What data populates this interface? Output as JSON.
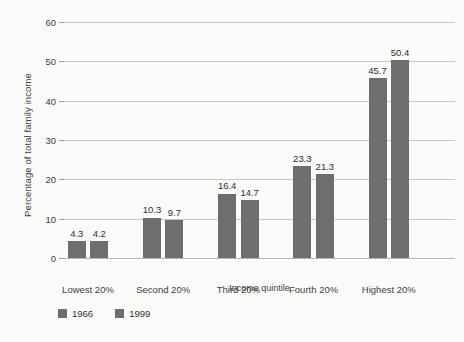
{
  "chart_data": {
    "type": "bar",
    "title": "",
    "xlabel": "Income quintile",
    "ylabel": "Percentage of total family income",
    "categories": [
      "Lowest 20%",
      "Second 20%",
      "Third 20%",
      "Fourth 20%",
      "Highest 20%"
    ],
    "series": [
      {
        "name": "1966",
        "values": [
          4.3,
          10.3,
          16.4,
          23.3,
          45.7
        ],
        "color": "#6e6e6e"
      },
      {
        "name": "1999",
        "values": [
          4.2,
          9.7,
          14.7,
          21.3,
          50.4
        ],
        "color": "#6e6e6e"
      }
    ],
    "ylim": [
      0,
      60
    ],
    "yticks": [
      0,
      10,
      20,
      30,
      40,
      50,
      60
    ],
    "ytick_labels": [
      "0",
      "10",
      "20",
      "30",
      "40",
      "50",
      "60"
    ],
    "grid": true,
    "grid_axis": "y",
    "legend_position": "below-left",
    "value_labels": true,
    "bar_color": "#6e6e6e",
    "grid_color": "#c8c8c8",
    "background": "#fbfbfa"
  }
}
